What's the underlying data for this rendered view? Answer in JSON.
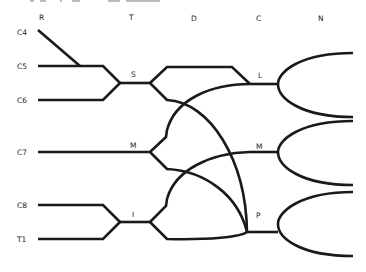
{
  "diagram": {
    "type": "tournament-bracket",
    "column_headers": [
      "R",
      "T",
      "D",
      "C",
      "N"
    ],
    "entrants": [
      "C4",
      "C5",
      "C6",
      "C7",
      "C8",
      "T1"
    ],
    "nodes": {
      "S": "S",
      "M_left": "M",
      "I": "I",
      "L": "L",
      "M_right": "M",
      "P": "P"
    },
    "connections": [
      {
        "from": "C4",
        "to": "C5-line"
      },
      {
        "from": "C5",
        "to": "S"
      },
      {
        "from": "C6",
        "to": "S"
      },
      {
        "from": "C7",
        "to": "M_left"
      },
      {
        "from": "C8",
        "to": "I"
      },
      {
        "from": "T1",
        "to": "I"
      },
      {
        "from": "S",
        "to": "L"
      },
      {
        "from": "S",
        "to": "P"
      },
      {
        "from": "M_left",
        "to": "L"
      },
      {
        "from": "M_left",
        "to": "M_right"
      },
      {
        "from": "I",
        "to": "M_right"
      },
      {
        "from": "I",
        "to": "P"
      },
      {
        "from": "L",
        "to": "N"
      },
      {
        "from": "M_right",
        "to": "N"
      },
      {
        "from": "P",
        "to": "N"
      }
    ]
  }
}
